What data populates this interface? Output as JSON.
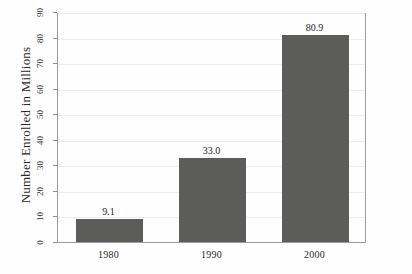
{
  "chart_data": {
    "type": "bar",
    "title": "",
    "xlabel": "",
    "ylabel": "Number Enrolled in Millions",
    "categories": [
      "1980",
      "1990",
      "2000"
    ],
    "values": [
      9.1,
      33.0,
      80.9
    ],
    "value_labels": [
      "9.1",
      "33.0",
      "80.9"
    ],
    "ylim": [
      0,
      90
    ],
    "ytick_labels": [
      "0",
      "10",
      "20",
      "30",
      "40",
      "50",
      "60",
      "70",
      "80",
      "90"
    ],
    "ytick_values": [
      0,
      10,
      20,
      30,
      40,
      50,
      60,
      70,
      80,
      90
    ],
    "grid": true,
    "legend": false,
    "bar_color": "#5c5c5a",
    "frame_color": "#9a9a9a",
    "grid_color": "#ededed",
    "background_color": "#fefefe"
  },
  "axis": {
    "y_title": "Number Enrolled in Millions"
  }
}
